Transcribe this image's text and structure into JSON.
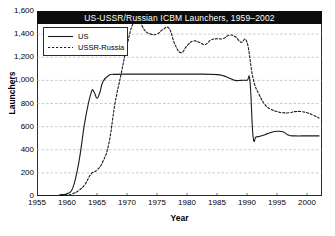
{
  "chart_data": {
    "type": "line",
    "title": "US-USSR/Russian ICBM Launchers, 1959–2002",
    "xlabel": "Year",
    "ylabel": "Launchers",
    "xlim": [
      1955,
      2002.5
    ],
    "ylim": [
      0,
      1600
    ],
    "xticks": [
      1955,
      1960,
      1965,
      1970,
      1975,
      1980,
      1985,
      1990,
      1995,
      2000
    ],
    "xtick_labels": [
      "1955",
      "1960",
      "1965",
      "1970",
      "1975",
      "1980",
      "1985",
      "1990",
      "1995",
      "2000"
    ],
    "yticks": [
      0,
      200,
      400,
      600,
      800,
      1000,
      1200,
      1400,
      1600
    ],
    "ytick_labels": [
      "0",
      "200",
      "400",
      "600",
      "800",
      "1,000",
      "1,200",
      "1,400",
      "1,600"
    ],
    "grid": "horizontal-dashed",
    "legend_position": "top-left",
    "series": [
      {
        "name": "US",
        "style": "solid",
        "color": "#1a1a1a",
        "x": [
          1955,
          1958,
          1959,
          1960,
          1961,
          1962,
          1963,
          1964,
          1964.5,
          1965,
          1965.5,
          1966,
          1967,
          1968,
          1970,
          1975,
          1980,
          1985,
          1987,
          1988,
          1989,
          1990,
          1990.5,
          1991,
          1991.5,
          1992,
          1993,
          1994,
          1995,
          1996,
          1997,
          1998,
          2000,
          2002
        ],
        "values": [
          0,
          0,
          12,
          20,
          75,
          300,
          650,
          890,
          900,
          845,
          900,
          990,
          1045,
          1052,
          1054,
          1054,
          1054,
          1050,
          1020,
          1000,
          1000,
          1000,
          990,
          520,
          512,
          515,
          530,
          550,
          560,
          555,
          525,
          520,
          520,
          520
        ]
      },
      {
        "name": "USSR-Russia",
        "style": "dashed",
        "color": "#1a1a1a",
        "x": [
          1955,
          1959,
          1960,
          1961,
          1962,
          1963,
          1964,
          1965,
          1966,
          1967,
          1968,
          1969,
          1970,
          1971,
          1972,
          1973,
          1974,
          1975,
          1976,
          1977,
          1978,
          1979,
          1980,
          1981,
          1982,
          1983,
          1984,
          1985,
          1986,
          1987,
          1988,
          1989,
          1990,
          1991,
          1992,
          1993,
          1994,
          1995,
          1996,
          1997,
          1998,
          1999,
          2000,
          2001,
          2002
        ],
        "values": [
          0,
          4,
          8,
          20,
          50,
          100,
          190,
          225,
          300,
          460,
          800,
          1050,
          1300,
          1490,
          1510,
          1430,
          1400,
          1400,
          1440,
          1450,
          1310,
          1240,
          1300,
          1340,
          1330,
          1310,
          1350,
          1360,
          1360,
          1390,
          1380,
          1330,
          1330,
          1020,
          880,
          790,
          750,
          730,
          720,
          720,
          730,
          730,
          720,
          700,
          675
        ]
      }
    ]
  }
}
